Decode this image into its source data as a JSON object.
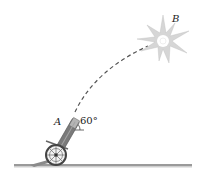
{
  "figure": {
    "type": "projectile-motion-diagram",
    "labels": {
      "point_a": "A",
      "point_b": "B",
      "angle": "60°"
    },
    "angle_degrees": 60,
    "colors": {
      "ground": "#8a8a8a",
      "trajectory": "#555555",
      "cannon": "#6b6b6b",
      "burst": "#d0d0d0",
      "text": "#222222"
    }
  }
}
